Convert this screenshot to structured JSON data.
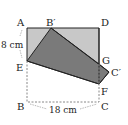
{
  "diagram": {
    "type": "folded-rectangle",
    "points": {
      "A": {
        "label": "A",
        "x": 27,
        "y": 28
      },
      "B_prime": {
        "label": "B′",
        "x": 51,
        "y": 28
      },
      "D": {
        "label": "D",
        "x": 99,
        "y": 28
      },
      "E": {
        "label": "E",
        "x": 27,
        "y": 61
      },
      "G": {
        "label": "G",
        "x": 99,
        "y": 64
      },
      "C_prime": {
        "label": "C′",
        "x": 109,
        "y": 72
      },
      "F": {
        "label": "F",
        "x": 99,
        "y": 84
      },
      "B": {
        "label": "B",
        "x": 27,
        "y": 102
      },
      "C": {
        "label": "C",
        "x": 99,
        "y": 102
      }
    },
    "measurements": {
      "AE": "8 cm",
      "BC": "18 cm"
    },
    "colors": {
      "rectangle_fill": "#c8c8c8",
      "folded_fill": "#7a7a7a",
      "stroke": "#222222",
      "dashed": "#888888"
    }
  }
}
